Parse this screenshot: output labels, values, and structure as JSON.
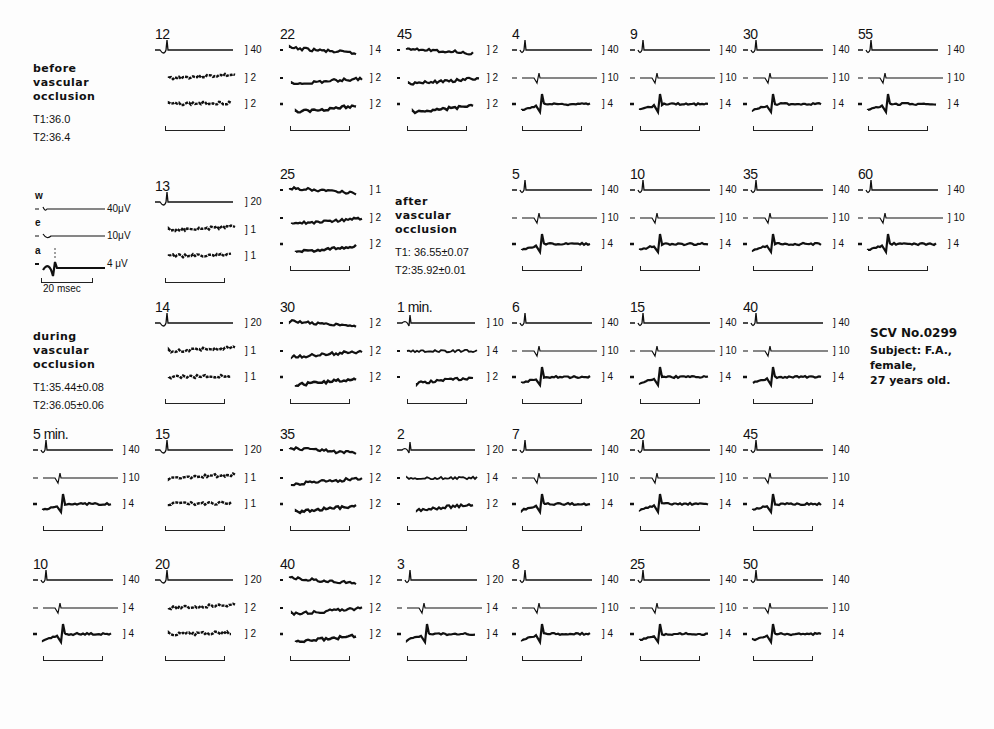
{
  "figure": {
    "conditions": [
      {
        "id": "before",
        "lines": [
          "before",
          "vascular",
          "occlusion"
        ],
        "t1": "T1:36.0",
        "t2": "T2:36.4"
      },
      {
        "id": "during",
        "lines": [
          "during",
          "vascular",
          "occlusion"
        ],
        "t1": "T1:35.44±0.08",
        "t2": "T2:36.05±0.06"
      },
      {
        "id": "after",
        "lines": [
          "after",
          "vascular",
          "occlusion"
        ],
        "t1": "T1: 36.55±0.07",
        "t2": "T2:35.92±0.01"
      }
    ],
    "legend": {
      "channels": [
        {
          "letter": "w",
          "scale": "40μV"
        },
        {
          "letter": "e",
          "scale": "10μV"
        },
        {
          "letter": "a",
          "scale": "4 μV"
        }
      ],
      "timebar": "20 msec"
    },
    "info": {
      "scv": "SCV No.0299",
      "subject": "Subject: F.A.,",
      "sex": "female,",
      "age": "27 years old."
    },
    "panels": [
      {
        "label": "12",
        "x": 155,
        "y": 40,
        "type": "dep",
        "scales": [
          "40",
          "2",
          "2"
        ]
      },
      {
        "label": "22",
        "x": 280,
        "y": 40,
        "type": "noise",
        "scales": [
          "4",
          "2",
          "2"
        ]
      },
      {
        "label": "45",
        "x": 397,
        "y": 40,
        "type": "noise",
        "scales": [
          "2",
          "2",
          "2"
        ]
      },
      {
        "label": "4",
        "x": 512,
        "y": 40,
        "type": "normal",
        "scales": [
          "40",
          "10",
          "4"
        ]
      },
      {
        "label": "9",
        "x": 630,
        "y": 40,
        "type": "normal",
        "scales": [
          "40",
          "10",
          "4"
        ]
      },
      {
        "label": "30",
        "x": 743,
        "y": 40,
        "type": "normal",
        "scales": [
          "40",
          "10",
          "4"
        ]
      },
      {
        "label": "55",
        "x": 858,
        "y": 40,
        "type": "normal",
        "scales": [
          "40",
          "10",
          "4"
        ]
      },
      {
        "label": "13",
        "x": 155,
        "y": 192,
        "type": "dep",
        "scales": [
          "20",
          "1",
          "1"
        ]
      },
      {
        "label": "25",
        "x": 280,
        "y": 180,
        "type": "noise",
        "scales": [
          "1",
          "2",
          "2"
        ]
      },
      {
        "label": "5",
        "x": 512,
        "y": 180,
        "type": "normal",
        "scales": [
          "40",
          "10",
          "4"
        ]
      },
      {
        "label": "10",
        "x": 630,
        "y": 180,
        "type": "normal",
        "scales": [
          "40",
          "10",
          "4"
        ]
      },
      {
        "label": "35",
        "x": 743,
        "y": 180,
        "type": "normal",
        "scales": [
          "40",
          "10",
          "4"
        ]
      },
      {
        "label": "60",
        "x": 858,
        "y": 180,
        "type": "normal",
        "scales": [
          "40",
          "10",
          "4"
        ]
      },
      {
        "label": "14",
        "x": 155,
        "y": 313,
        "type": "dep",
        "scales": [
          "20",
          "1",
          "1"
        ]
      },
      {
        "label": "30",
        "x": 280,
        "y": 313,
        "type": "noise",
        "scales": [
          "2",
          "2",
          "2"
        ]
      },
      {
        "label": "1 min.",
        "x": 397,
        "y": 313,
        "type": "early",
        "scales": [
          "10",
          "4",
          "2"
        ]
      },
      {
        "label": "6",
        "x": 512,
        "y": 313,
        "type": "normal",
        "scales": [
          "40",
          "10",
          "4"
        ]
      },
      {
        "label": "15",
        "x": 630,
        "y": 313,
        "type": "normal",
        "scales": [
          "40",
          "10",
          "4"
        ]
      },
      {
        "label": "40",
        "x": 743,
        "y": 313,
        "type": "normal",
        "scales": [
          "40",
          "10",
          "4"
        ]
      },
      {
        "label": "5 min.",
        "x": 33,
        "y": 440,
        "type": "normal",
        "scales": [
          "40",
          "10",
          "4"
        ]
      },
      {
        "label": "15",
        "x": 155,
        "y": 440,
        "type": "dep",
        "scales": [
          "20",
          "1",
          "1"
        ]
      },
      {
        "label": "35",
        "x": 280,
        "y": 440,
        "type": "noise",
        "scales": [
          "2",
          "2",
          "2"
        ]
      },
      {
        "label": "2",
        "x": 397,
        "y": 440,
        "type": "early",
        "scales": [
          "20",
          "4",
          "2"
        ]
      },
      {
        "label": "7",
        "x": 512,
        "y": 440,
        "type": "normal",
        "scales": [
          "40",
          "10",
          "4"
        ]
      },
      {
        "label": "20",
        "x": 630,
        "y": 440,
        "type": "normal",
        "scales": [
          "40",
          "10",
          "4"
        ]
      },
      {
        "label": "45",
        "x": 743,
        "y": 440,
        "type": "normal",
        "scales": [
          "40",
          "10",
          "4"
        ]
      },
      {
        "label": "10",
        "x": 33,
        "y": 570,
        "type": "normal",
        "scales": [
          "40",
          "4",
          "4"
        ]
      },
      {
        "label": "20",
        "x": 155,
        "y": 570,
        "type": "dep",
        "scales": [
          "20",
          "2",
          "2"
        ]
      },
      {
        "label": "40",
        "x": 280,
        "y": 570,
        "type": "noise",
        "scales": [
          "2",
          "2",
          "2"
        ]
      },
      {
        "label": "3",
        "x": 397,
        "y": 570,
        "type": "normal",
        "scales": [
          "20",
          "4",
          "4"
        ]
      },
      {
        "label": "8",
        "x": 512,
        "y": 570,
        "type": "normal",
        "scales": [
          "40",
          "10",
          "4"
        ]
      },
      {
        "label": "25",
        "x": 630,
        "y": 570,
        "type": "normal",
        "scales": [
          "40",
          "10",
          "4"
        ]
      },
      {
        "label": "50",
        "x": 743,
        "y": 570,
        "type": "normal",
        "scales": [
          "40",
          "10",
          "4"
        ]
      }
    ]
  }
}
